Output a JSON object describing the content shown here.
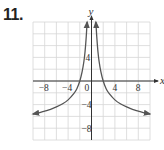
{
  "problem": {
    "number": "11."
  },
  "chart_data": {
    "type": "line",
    "title": "",
    "xlabel": "x",
    "ylabel": "y",
    "xlim": [
      -10,
      10
    ],
    "ylim": [
      -10,
      10
    ],
    "grid": true,
    "grid_step": 2,
    "x_ticks": [
      {
        "value": -8,
        "label": "−8"
      },
      {
        "value": -4,
        "label": "−4"
      },
      {
        "value": 0,
        "label": "0"
      },
      {
        "value": 4,
        "label": "4"
      },
      {
        "value": 8,
        "label": "8"
      }
    ],
    "y_ticks": [
      {
        "value": 4,
        "label": "4"
      },
      {
        "value": -4,
        "label": "−4"
      },
      {
        "value": -8,
        "label": "−8"
      }
    ],
    "series": [
      {
        "name": "right-branch",
        "x": [
          0.75,
          0.9,
          1.1,
          1.3,
          1.6,
          2.0,
          2.5,
          3,
          4,
          5,
          6,
          7,
          8,
          9,
          10
        ],
        "y": [
          10,
          7.5,
          5.0,
          3.3,
          1.6,
          0,
          -1.3,
          -2.1,
          -3.2,
          -3.9,
          -4.4,
          -4.8,
          -5.1,
          -5.4,
          -5.6
        ]
      },
      {
        "name": "left-branch",
        "x": [
          -0.75,
          -0.9,
          -1.1,
          -1.3,
          -1.6,
          -2.0,
          -2.5,
          -3,
          -4,
          -5,
          -6,
          -7,
          -8,
          -9,
          -10
        ],
        "y": [
          10,
          7.5,
          5.0,
          3.3,
          1.6,
          0,
          -1.3,
          -2.1,
          -3.2,
          -3.9,
          -4.4,
          -4.8,
          -5.1,
          -5.4,
          -5.6
        ]
      }
    ],
    "annotations": [
      "vertical asymptote at x = 0",
      "symmetric about y-axis",
      "arrows at branch ends"
    ],
    "colors": {
      "curve": "#555555",
      "axis": "#333333",
      "grid": "#d6d6d6"
    }
  }
}
